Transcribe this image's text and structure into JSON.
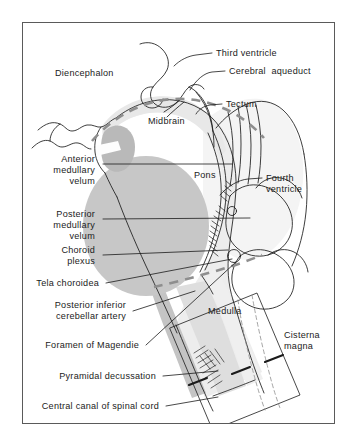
{
  "figure": {
    "domain": "anatomical-diagram",
    "title_visible": false,
    "background_color": "#ffffff",
    "frame_color": "#5a5a5a",
    "ink_color": "#1b1b1b",
    "fill_dark_gray": "#c0c0c0",
    "fill_mid_gray": "#cfcfcf",
    "fill_light_gray": "#e2e2e2",
    "fill_pale_gray": "#ededed",
    "dashed_line_color": "#9a9a9a"
  },
  "labels": {
    "diencephalon": "Diencephalon",
    "third_ventricle": "Third ventricle",
    "cerebral_aqueduct": "Cerebral  aqueduct",
    "tectum": "Tectum",
    "midbrain": "Midbrain",
    "pons": "Pons",
    "fourth_ventricle_line1": "Fourth",
    "fourth_ventricle_line2": "ventricle",
    "anterior_medullary_velum_line1": "Anterior",
    "anterior_medullary_velum_line2": "medullary",
    "anterior_medullary_velum_line3": "velum",
    "posterior_medullary_velum_line1": "Posterior",
    "posterior_medullary_velum_line2": "medullary",
    "posterior_medullary_velum_line3": "velum",
    "choroid_plexus_line1": "Choroid",
    "choroid_plexus_line2": "plexus",
    "tela_choroidea": "Tela choroidea",
    "posterior_inferior_cerebellar_artery_line1": "Posterior inferior",
    "posterior_inferior_cerebellar_artery_line2": "cerebellar artery",
    "foramen_of_magendie": "Foramen of Magendie",
    "pyramidal_decussation": "Pyramidal decussation",
    "central_canal_of_spinal_cord": "Central canal of spinal cord",
    "medulla": "Medulla",
    "cisterna_magna_line1": "Cisterna",
    "cisterna_magna_line2": "magna"
  },
  "structures": [
    {
      "name": "diencephalon",
      "label": "Diencephalon",
      "side": "left",
      "shaded": false
    },
    {
      "name": "midbrain",
      "label": "Midbrain",
      "side": "center",
      "shaded": false
    },
    {
      "name": "pons",
      "label": "Pons",
      "side": "center",
      "shaded": false
    },
    {
      "name": "medulla",
      "label": "Medulla",
      "side": "center",
      "shaded": false
    },
    {
      "name": "fourth-ventricle",
      "label": "Fourth ventricle",
      "side": "right",
      "shaded": false
    },
    {
      "name": "cerebellum",
      "label": "",
      "side": "right",
      "shaded": false
    },
    {
      "name": "cisterna-magna",
      "label": "Cisterna magna",
      "side": "right",
      "shaded": false
    },
    {
      "name": "choroid-plexus",
      "label": "Choroid plexus",
      "side": "left",
      "shaded": true
    },
    {
      "name": "tela-choroidea",
      "label": "Tela choroidea",
      "side": "left",
      "shaded": true
    },
    {
      "name": "anterior-medullary-velum",
      "label": "Anterior medullary velum",
      "side": "left",
      "shaded": false
    },
    {
      "name": "posterior-medullary-velum",
      "label": "Posterior medullary velum",
      "side": "left",
      "shaded": true
    },
    {
      "name": "posterior-inferior-cerebellar-artery",
      "label": "Posterior inferior cerebellar artery",
      "side": "left",
      "shaded": false
    },
    {
      "name": "foramen-of-magendie",
      "label": "Foramen of Magendie",
      "side": "left",
      "shaded": false
    },
    {
      "name": "pyramidal-decussation",
      "label": "Pyramidal decussation",
      "side": "left",
      "shaded": false
    },
    {
      "name": "central-canal-of-spinal-cord",
      "label": "Central canal of spinal cord",
      "side": "left",
      "shaded": false
    },
    {
      "name": "third-ventricle",
      "label": "Third ventricle",
      "side": "right",
      "shaded": false
    },
    {
      "name": "cerebral-aqueduct",
      "label": "Cerebral aqueduct",
      "side": "right",
      "shaded": false
    },
    {
      "name": "tectum",
      "label": "Tectum",
      "side": "right",
      "shaded": false
    }
  ]
}
